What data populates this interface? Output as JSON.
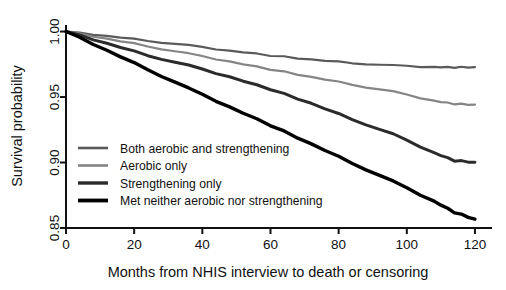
{
  "chart_data": {
    "type": "line",
    "title": "",
    "xlabel": "Months from NHIS interview to death or censoring",
    "ylabel": "Survival probability",
    "xlim": [
      0,
      125
    ],
    "ylim": [
      0.85,
      1.005
    ],
    "xticks": [
      0,
      20,
      40,
      60,
      80,
      100,
      120
    ],
    "xtick_labels": [
      "0",
      "20",
      "40",
      "60",
      "80",
      "100",
      "120"
    ],
    "yticks": [
      0.85,
      0.9,
      0.95,
      1.0
    ],
    "ytick_labels": [
      "0.85",
      "0.90",
      "0.95",
      "1.00"
    ],
    "grid": false,
    "legend_position": "lower left",
    "x": [
      0,
      12,
      24,
      36,
      48,
      60,
      72,
      84,
      96,
      108,
      114,
      120
    ],
    "series": [
      {
        "name": "Both aerobic and strengthening",
        "color": "#5a5a5a",
        "values": [
          1.0,
          0.9965,
          0.993,
          0.9893,
          0.9855,
          0.9818,
          0.9785,
          0.976,
          0.974,
          0.973,
          0.9727,
          0.9726
        ]
      },
      {
        "name": "Aerobic only",
        "color": "#858585",
        "values": [
          1.0,
          0.9944,
          0.9888,
          0.983,
          0.9772,
          0.9712,
          0.9652,
          0.9595,
          0.954,
          0.9472,
          0.9448,
          0.944
        ]
      },
      {
        "name": "Strengthening only",
        "color": "#2b2b2b",
        "values": [
          1.0,
          0.9908,
          0.9818,
          0.974,
          0.9655,
          0.956,
          0.945,
          0.933,
          0.9215,
          0.9075,
          0.9015,
          0.9
        ]
      },
      {
        "name": "Met neither aerobic nor strengthening",
        "color": "#000000",
        "values": [
          1.0,
          0.9855,
          0.971,
          0.9565,
          0.9425,
          0.9285,
          0.914,
          0.8995,
          0.8855,
          0.8705,
          0.862,
          0.8565
        ]
      }
    ]
  },
  "legend": {
    "entries": [
      {
        "label": "Both aerobic and strengthening"
      },
      {
        "label": "Aerobic only"
      },
      {
        "label": "Strengthening only"
      },
      {
        "label": "Met neither aerobic nor strengthening"
      }
    ]
  }
}
